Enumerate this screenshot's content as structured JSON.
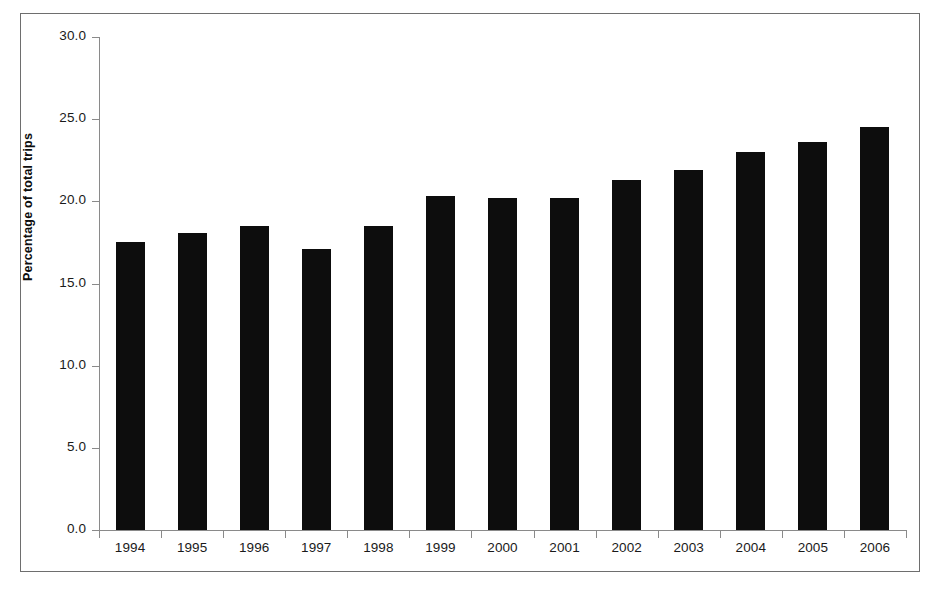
{
  "chart_data": {
    "type": "bar",
    "title": "",
    "xlabel": "",
    "ylabel": "Percentage of total trips",
    "categories": [
      "1994",
      "1995",
      "1996",
      "1997",
      "1998",
      "1999",
      "2000",
      "2001",
      "2002",
      "2003",
      "2004",
      "2005",
      "2006"
    ],
    "values": [
      17.5,
      18.1,
      18.5,
      17.1,
      18.5,
      20.3,
      20.2,
      20.2,
      21.3,
      21.9,
      23.0,
      23.6,
      24.5
    ],
    "ylim": [
      0.0,
      30.0
    ],
    "ytick_labels": [
      "30.0",
      "25.0",
      "20.0",
      "15.0",
      "10.0",
      "5.0",
      "0.0"
    ],
    "ytick_values": [
      30.0,
      25.0,
      20.0,
      15.0,
      10.0,
      5.0,
      0.0
    ],
    "grid": false,
    "legend": "none",
    "bar_color": "#0d0d0d",
    "axis_color": "#8a8a8a",
    "frame_color": "#6e6e6e",
    "background": "#ffffff"
  }
}
